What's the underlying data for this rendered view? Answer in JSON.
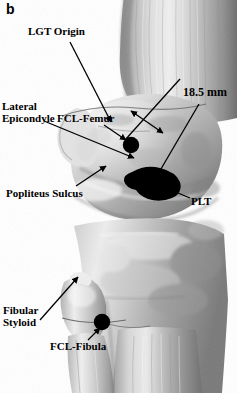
{
  "figure": {
    "panel_letter": "b",
    "width_px": 237,
    "height_px": 393,
    "type": "grayscale-anatomical-photograph",
    "background_color": "#ffffff",
    "annotation_color": "#000000"
  },
  "labels": {
    "lgt_origin": "LGT Origin",
    "lateral_epicondyle": "Lateral\nEpicondyle",
    "fcl_femur": "FCL-Femur",
    "popliteus_sulcus": "Popliteus Sulcus",
    "plt": "PLT",
    "measurement": "18.5 mm",
    "fibular_styloid": "Fibular\nStyloid",
    "fcl_fibula": "FCL-Fibula"
  },
  "measurements": [
    {
      "label": "18.5 mm",
      "value": 18.5,
      "unit": "mm",
      "description": "distance between FCL femoral attachment and popliteus tendon attachment"
    }
  ],
  "markers": [
    {
      "name": "fcl-femur-marker",
      "shape": "filled-circle",
      "color": "#000000",
      "cx": 131,
      "cy": 145,
      "r": 8
    },
    {
      "name": "plt-marker",
      "shape": "filled-bean",
      "color": "#000000",
      "cx": 155,
      "cy": 184
    },
    {
      "name": "fcl-fibula-marker",
      "shape": "filled-circle",
      "color": "#000000",
      "cx": 102,
      "cy": 322,
      "r": 8
    }
  ],
  "anatomy": {
    "femur_shaft": "proximal region, upper right",
    "lateral_femoral_condyle": "mid region",
    "tibial_plateau": "below joint line",
    "fibular_head": "lower left of tibia",
    "fibula_shaft": "lower left"
  }
}
